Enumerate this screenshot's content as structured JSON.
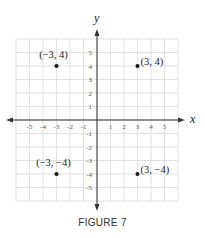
{
  "figure": {
    "caption": "FIGURE 7",
    "x_axis_label": "x",
    "y_axis_label": "y",
    "x_ticks": [
      "-5",
      "-4",
      "-3",
      "-2",
      "-1",
      "1",
      "2",
      "3",
      "4",
      "5"
    ],
    "y_ticks": [
      "5",
      "4",
      "3",
      "2",
      "1",
      "-1",
      "-2",
      "-3",
      "-4",
      "-5"
    ],
    "points": [
      {
        "x": -3,
        "y": 4,
        "label": "(−3, 4)"
      },
      {
        "x": 3,
        "y": 4,
        "label": "(3, 4)"
      },
      {
        "x": -3,
        "y": -4,
        "label": "(−3, −4)"
      },
      {
        "x": 3,
        "y": -4,
        "label": "(3, −4)"
      }
    ],
    "grid_range": [
      -6,
      6
    ],
    "colors": {
      "grid": "#d9d9d9",
      "axis": "#333333",
      "point": "#111111"
    }
  }
}
